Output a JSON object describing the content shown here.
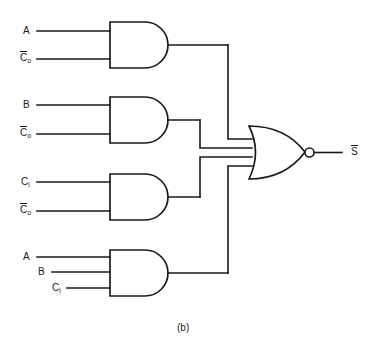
{
  "figure": {
    "caption": "(b)",
    "line_color": "#1a1a1a",
    "background": "#ffffff"
  },
  "output": {
    "label_base": "S",
    "overbar": true,
    "bubble": "inverting-bubble"
  },
  "gates": [
    {
      "id": "and-1",
      "type": "AND",
      "inputs": [
        {
          "base": "A",
          "overbar": false,
          "subscript": ""
        },
        {
          "base": "C",
          "overbar": true,
          "subscript": "o"
        }
      ]
    },
    {
      "id": "and-2",
      "type": "AND",
      "inputs": [
        {
          "base": "B",
          "overbar": false,
          "subscript": ""
        },
        {
          "base": "C",
          "overbar": true,
          "subscript": "o"
        }
      ]
    },
    {
      "id": "and-3",
      "type": "AND",
      "inputs": [
        {
          "base": "C",
          "overbar": false,
          "subscript": "i"
        },
        {
          "base": "C",
          "overbar": true,
          "subscript": "o"
        }
      ]
    },
    {
      "id": "and-4",
      "type": "AND",
      "inputs": [
        {
          "base": "A",
          "overbar": false,
          "subscript": ""
        },
        {
          "base": "B",
          "overbar": false,
          "subscript": ""
        },
        {
          "base": "C",
          "overbar": false,
          "subscript": "i"
        }
      ]
    },
    {
      "id": "nor-1",
      "type": "NOR",
      "input_count": 4
    }
  ],
  "labels": {
    "g1_in1": "A",
    "g1_in2_base": "C",
    "g1_in2_sub": "o",
    "g2_in1": "B",
    "g2_in2_base": "C",
    "g2_in2_sub": "o",
    "g3_in1_base": "C",
    "g3_in1_sub": "i",
    "g3_in2_base": "C",
    "g3_in2_sub": "o",
    "g4_in1": "A",
    "g4_in2": "B",
    "g4_in3_base": "C",
    "g4_in3_sub": "i",
    "out_base": "S"
  }
}
